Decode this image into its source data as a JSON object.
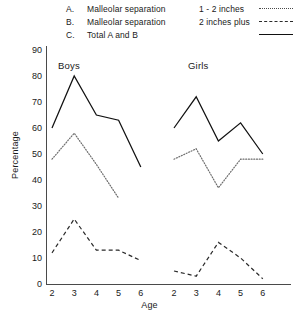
{
  "legend": {
    "rows": [
      {
        "key": "A.",
        "desc": "Malleolar   separation",
        "value": "1 - 2 inches",
        "style": "dotted"
      },
      {
        "key": "B.",
        "desc": "Malleolar   separation",
        "value": "2 inches plus",
        "style": "dashed"
      },
      {
        "key": "C.",
        "desc": "Total A and B",
        "value": "",
        "style": "solid"
      }
    ]
  },
  "axes": {
    "ylabel": "Percentage",
    "xlabel": "Age",
    "yticks": [
      "90",
      "80",
      "70",
      "60",
      "50",
      "40",
      "30",
      "20",
      "10",
      "0"
    ],
    "xticks_boys": [
      "2",
      "3",
      "4",
      "5",
      "6"
    ],
    "xticks_girls": [
      "2",
      "3",
      "4",
      "5",
      "6"
    ]
  },
  "panels": {
    "boys_title": "Boys",
    "girls_title": "Girls"
  },
  "chart_data": {
    "type": "line",
    "title": "",
    "xlabel": "Age",
    "ylabel": "Percentage",
    "ylim": [
      0,
      90
    ],
    "xlim": [
      2,
      6
    ],
    "grid": false,
    "legend_position": "top",
    "panels": [
      {
        "name": "Boys",
        "x": [
          2,
          3,
          4,
          5,
          6
        ],
        "series": [
          {
            "name": "C. Total A and B",
            "style": "solid",
            "x": [
              2,
              3,
              4,
              5,
              6
            ],
            "values": [
              60,
              80,
              65,
              63,
              45
            ]
          },
          {
            "name": "A. Malleolar separation 1 - 2 inches",
            "style": "dotted",
            "x": [
              2,
              3,
              4,
              5
            ],
            "values": [
              48,
              58,
              46,
              33
            ]
          },
          {
            "name": "B. Malleolar separation 2 inches plus",
            "style": "dashed",
            "x": [
              2,
              3,
              4,
              5,
              6
            ],
            "values": [
              12,
              25,
              13,
              13,
              9
            ]
          }
        ]
      },
      {
        "name": "Girls",
        "x": [
          2,
          3,
          4,
          5,
          6
        ],
        "series": [
          {
            "name": "C. Total A and B",
            "style": "solid",
            "x": [
              2,
              3,
              4,
              5,
              6
            ],
            "values": [
              60,
              72,
              55,
              62,
              50
            ]
          },
          {
            "name": "A. Malleolar separation 1 - 2 inches",
            "style": "dotted",
            "x": [
              2,
              3,
              4,
              5,
              6
            ],
            "values": [
              48,
              52,
              37,
              48,
              48
            ]
          },
          {
            "name": "B. Malleolar separation 2 inches plus",
            "style": "dashed",
            "x": [
              2,
              3,
              4,
              5,
              6
            ],
            "values": [
              5,
              3,
              16,
              10,
              2
            ]
          }
        ]
      }
    ]
  }
}
